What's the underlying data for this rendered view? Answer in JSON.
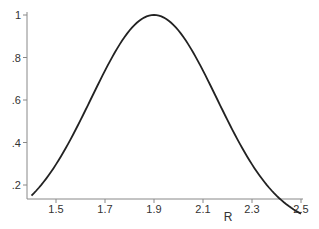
{
  "chart_data": {
    "type": "line",
    "title": "",
    "xlabel": "R",
    "ylabel": "",
    "xlim": [
      1.4,
      2.5
    ],
    "ylim": [
      0.13,
      1.0
    ],
    "x_ticks": [
      "1.5",
      "1.7",
      "1.9",
      "2.1",
      "2.3",
      "2.5"
    ],
    "y_ticks": [
      ".2",
      ".4",
      ".6",
      ".8",
      "1"
    ],
    "grid": false,
    "legend": null,
    "series": [
      {
        "name": "density",
        "x": [
          1.4,
          1.5,
          1.6,
          1.7,
          1.8,
          1.9,
          2.0,
          2.1,
          2.2,
          2.3,
          2.4,
          2.5
        ],
        "values": [
          0.15,
          0.3,
          0.51,
          0.74,
          0.93,
          1.0,
          0.93,
          0.74,
          0.51,
          0.3,
          0.15,
          0.07
        ]
      }
    ],
    "color": "#222222"
  },
  "axis": {
    "x_label": "R",
    "x_ticks": [
      "1.5",
      "1.7",
      "1.9",
      "2.1",
      "2.3",
      "2.5"
    ],
    "y_ticks": [
      ".2",
      ".4",
      ".6",
      ".8",
      "1"
    ]
  }
}
